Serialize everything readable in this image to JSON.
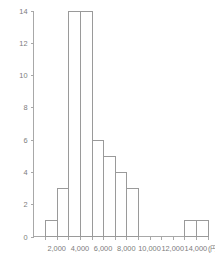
{
  "chart_data": {
    "type": "bar",
    "title": "",
    "subtitle": "",
    "xlabel": "(円)",
    "ylabel": "",
    "grid": false,
    "legend": null,
    "xlim": [
      0,
      15000
    ],
    "ylim": [
      0,
      14
    ],
    "bin_width": 1000,
    "x_tick_values": [
      2000,
      4000,
      6000,
      8000,
      10000,
      12000,
      14000
    ],
    "x_tick_labels": [
      "2,000",
      "4,000",
      "6,000",
      "8,000",
      "10,000",
      "12,000",
      "14,000"
    ],
    "y_tick_values": [
      0,
      2,
      4,
      6,
      8,
      10,
      12,
      14
    ],
    "y_tick_labels": [
      "0",
      "2",
      "4",
      "6",
      "8",
      "10",
      "12",
      "14"
    ],
    "bins": [
      {
        "start": 1000,
        "end": 2000,
        "count": 1
      },
      {
        "start": 2000,
        "end": 3000,
        "count": 3
      },
      {
        "start": 3000,
        "end": 4000,
        "count": 14
      },
      {
        "start": 4000,
        "end": 5000,
        "count": 14
      },
      {
        "start": 5000,
        "end": 6000,
        "count": 6
      },
      {
        "start": 6000,
        "end": 7000,
        "count": 5
      },
      {
        "start": 7000,
        "end": 8000,
        "count": 4
      },
      {
        "start": 8000,
        "end": 9000,
        "count": 3
      },
      {
        "start": 13000,
        "end": 14000,
        "count": 1
      },
      {
        "start": 14000,
        "end": 15000,
        "count": 1
      }
    ],
    "categories": [
      "1,000-2,000",
      "2,000-3,000",
      "3,000-4,000",
      "4,000-5,000",
      "5,000-6,000",
      "6,000-7,000",
      "7,000-8,000",
      "8,000-9,000",
      "13,000-14,000",
      "14,000-15,000"
    ],
    "values": [
      1,
      3,
      14,
      14,
      6,
      5,
      4,
      3,
      1,
      1
    ],
    "colors": {
      "bar_fill": "#ffffff",
      "bar_stroke": "#9a9a9a",
      "axis": "#a8a8a8",
      "text": "#7d7d7d",
      "background": "#ffffff"
    }
  }
}
